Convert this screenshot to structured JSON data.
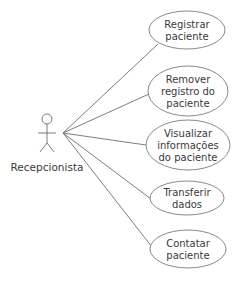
{
  "diagram": {
    "type": "uml-use-case",
    "actor": {
      "label": "Recepcionista",
      "x": 47,
      "y": 119
    },
    "association_origin": {
      "x": 63,
      "y": 133
    },
    "use_cases": [
      {
        "id": "uc1",
        "lines": [
          "Registrar",
          "paciente"
        ],
        "cx": 187,
        "cy": 30,
        "rx": 38,
        "ry": 19,
        "attach": {
          "x": 158,
          "y": 44
        }
      },
      {
        "id": "uc2",
        "lines": [
          "Remover",
          "registro do",
          "paciente"
        ],
        "cx": 188,
        "cy": 91,
        "rx": 40,
        "ry": 25,
        "attach": {
          "x": 149,
          "y": 94
        }
      },
      {
        "id": "uc3",
        "lines": [
          "Visualizar",
          "informações",
          "do paciente"
        ],
        "cx": 188,
        "cy": 145,
        "rx": 42,
        "ry": 25,
        "attach": {
          "x": 146,
          "y": 145
        }
      },
      {
        "id": "uc4",
        "lines": [
          "Transferir",
          "dados"
        ],
        "cx": 187,
        "cy": 198,
        "rx": 37,
        "ry": 17,
        "attach": {
          "x": 151,
          "y": 199
        }
      },
      {
        "id": "uc5",
        "lines": [
          "Contatar",
          "paciente"
        ],
        "cx": 188,
        "cy": 249,
        "rx": 38,
        "ry": 19,
        "attach": {
          "x": 152,
          "y": 247
        }
      }
    ]
  }
}
